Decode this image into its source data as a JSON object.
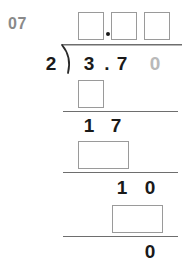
{
  "worksheet": {
    "problem_number": "07",
    "operation": "long-division",
    "divisor": "2",
    "dividend_digits": [
      "3",
      ".",
      "7",
      "0"
    ],
    "dividend_display": "3.70",
    "appended_zero": "0",
    "quotient_boxes": [
      {
        "name": "quotient-ones-box",
        "value": ""
      },
      {
        "name": "quotient-tenths-box",
        "value": ""
      },
      {
        "name": "quotient-hundredths-box",
        "value": ""
      }
    ],
    "quotient_decimal_point": ".",
    "work_rows": [
      {
        "name": "first-product-row",
        "kind": "input-box",
        "digits": 1,
        "value": ""
      },
      {
        "name": "first-remainder-row",
        "kind": "static",
        "digits": [
          "1",
          "7"
        ]
      },
      {
        "name": "second-product-row",
        "kind": "input-box",
        "digits": 2,
        "value": ""
      },
      {
        "name": "second-remainder-row",
        "kind": "static",
        "digits": [
          "1",
          "0"
        ]
      },
      {
        "name": "third-product-row",
        "kind": "input-box",
        "digits": 2,
        "value": ""
      },
      {
        "name": "final-remainder-row",
        "kind": "static",
        "digits": [
          "0"
        ]
      }
    ],
    "colors": {
      "ink": "#1a1a1a",
      "faded_ink": "#b9b9b9",
      "label": "#8a8a8a",
      "box_border": "#9a9a9a",
      "rule": "#6e6e6e",
      "paper": "#ffffff"
    }
  }
}
